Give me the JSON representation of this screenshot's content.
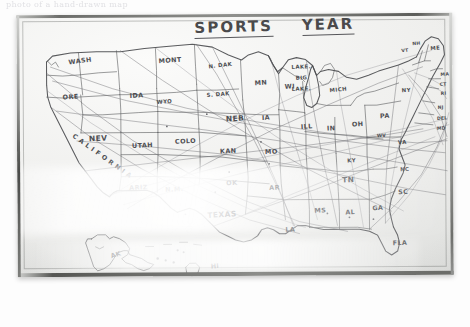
{
  "photo": {
    "top_cut_text": "photo of a hand-drawn map",
    "description": "Photograph of a hand-drawn map of the United States on a light board"
  },
  "board": {
    "title_part1": "SPORTS",
    "title_part2": "YEAR",
    "title_full": "SPORTS YEAR"
  },
  "colors": {
    "ink": "#4c4d50",
    "paper": "#eeeeec",
    "frame": "#55565a",
    "route": "#6d6e72"
  },
  "map": {
    "name": "united-states-hand-drawn-map",
    "labels": [
      {
        "text": "WASH",
        "x": 52,
        "y": 43,
        "size": "s-md",
        "rot": -7,
        "name": "state-label-washington"
      },
      {
        "text": "ORE",
        "x": 46,
        "y": 79,
        "size": "s-md",
        "rot": -4,
        "name": "state-label-oregon"
      },
      {
        "text": "IDA",
        "x": 113,
        "y": 78,
        "size": "s-md",
        "rot": -2,
        "name": "state-label-idaho"
      },
      {
        "text": "MONT",
        "x": 142,
        "y": 43,
        "size": "s-md",
        "rot": -4,
        "name": "state-label-montana"
      },
      {
        "text": "N. DAK",
        "x": 192,
        "y": 49,
        "size": "s-sm",
        "rot": -6,
        "name": "state-label-north-dakota"
      },
      {
        "text": "S. DAK",
        "x": 190,
        "y": 78,
        "size": "s-sm",
        "rot": -4,
        "name": "state-label-south-dakota"
      },
      {
        "text": "MN",
        "x": 238,
        "y": 66,
        "size": "s-md",
        "rot": -3,
        "name": "state-label-minnesota"
      },
      {
        "text": "WI",
        "x": 268,
        "y": 70,
        "size": "s-md",
        "rot": -2,
        "name": "state-label-wisconsin"
      },
      {
        "text": "WYO",
        "x": 140,
        "y": 85,
        "size": "s-sm",
        "rot": -3,
        "name": "state-label-wyoming"
      },
      {
        "text": "NEV",
        "x": 72,
        "y": 120,
        "size": "s-lg",
        "rot": -2,
        "name": "state-label-nevada"
      },
      {
        "text": "UTAH",
        "x": 115,
        "y": 128,
        "size": "s-md",
        "rot": -2,
        "name": "state-label-utah"
      },
      {
        "text": "COLO",
        "x": 158,
        "y": 124,
        "size": "s-md",
        "rot": -2,
        "name": "state-label-colorado"
      },
      {
        "text": "NEB",
        "x": 209,
        "y": 101,
        "size": "s-lg",
        "rot": -3,
        "name": "state-label-nebraska"
      },
      {
        "text": "IA",
        "x": 245,
        "y": 101,
        "size": "s-md",
        "rot": -2,
        "name": "state-label-iowa"
      },
      {
        "text": "KAN",
        "x": 203,
        "y": 134,
        "size": "s-md",
        "rot": -2,
        "name": "state-label-kansas"
      },
      {
        "text": "MO",
        "x": 248,
        "y": 135,
        "size": "s-md",
        "rot": -2,
        "name": "state-label-missouri"
      },
      {
        "text": "ARIZ",
        "x": 112,
        "y": 170,
        "size": "s-md",
        "rot": -2,
        "name": "state-label-arizona"
      },
      {
        "text": "N.M.",
        "x": 148,
        "y": 172,
        "size": "s-md",
        "rot": -2,
        "name": "state-label-new-mexico"
      },
      {
        "text": "OK",
        "x": 209,
        "y": 166,
        "size": "s-md",
        "rot": -2,
        "name": "state-label-oklahoma"
      },
      {
        "text": "AR",
        "x": 252,
        "y": 171,
        "size": "s-md",
        "rot": -2,
        "name": "state-label-arkansas"
      },
      {
        "text": "TEXAS",
        "x": 190,
        "y": 197,
        "size": "s-lg",
        "rot": -3,
        "name": "state-label-texas"
      },
      {
        "text": "LA",
        "x": 268,
        "y": 213,
        "size": "s-md",
        "rot": -2,
        "name": "state-label-louisiana"
      },
      {
        "text": "MS",
        "x": 297,
        "y": 194,
        "size": "s-md",
        "rot": -2,
        "name": "state-label-mississippi"
      },
      {
        "text": "AL",
        "x": 328,
        "y": 196,
        "size": "s-md",
        "rot": -2,
        "name": "state-label-alabama"
      },
      {
        "text": "GA",
        "x": 355,
        "y": 192,
        "size": "s-md",
        "rot": -2,
        "name": "state-label-georgia"
      },
      {
        "text": "SC",
        "x": 381,
        "y": 176,
        "size": "s-md",
        "rot": -2,
        "name": "state-label-south-carolina"
      },
      {
        "text": "NC",
        "x": 383,
        "y": 154,
        "size": "s-sm",
        "rot": -2,
        "name": "state-label-north-carolina"
      },
      {
        "text": "VA",
        "x": 381,
        "y": 127,
        "size": "s-sm",
        "rot": -2,
        "name": "state-label-virginia"
      },
      {
        "text": "TN",
        "x": 325,
        "y": 163,
        "size": "s-lg",
        "rot": -2,
        "name": "state-label-tennessee"
      },
      {
        "text": "KY",
        "x": 330,
        "y": 145,
        "size": "s-sm",
        "rot": -2,
        "name": "state-label-kentucky"
      },
      {
        "text": "FLA",
        "x": 375,
        "y": 227,
        "size": "s-md",
        "rot": -2,
        "name": "state-label-florida"
      },
      {
        "text": "ILL",
        "x": 284,
        "y": 110,
        "size": "s-md",
        "rot": -3,
        "name": "state-label-illinois"
      },
      {
        "text": "IN",
        "x": 310,
        "y": 112,
        "size": "s-md",
        "rot": -2,
        "name": "state-label-indiana"
      },
      {
        "text": "OH",
        "x": 335,
        "y": 108,
        "size": "s-md",
        "rot": -2,
        "name": "state-label-ohio"
      },
      {
        "text": "MICH",
        "x": 313,
        "y": 74,
        "size": "s-sm",
        "rot": -6,
        "name": "state-label-michigan"
      },
      {
        "text": "PA",
        "x": 363,
        "y": 100,
        "size": "s-md",
        "rot": -2,
        "name": "state-label-pennsylvania"
      },
      {
        "text": "NY",
        "x": 385,
        "y": 75,
        "size": "s-sm",
        "rot": -3,
        "name": "state-label-new-york"
      },
      {
        "text": "WV",
        "x": 360,
        "y": 121,
        "size": "s-xs",
        "rot": -2,
        "name": "state-label-west-virginia"
      },
      {
        "text": "VT",
        "x": 385,
        "y": 36,
        "size": "s-xs",
        "rot": -6,
        "name": "state-label-vermont"
      },
      {
        "text": "NH",
        "x": 396,
        "y": 29,
        "size": "s-xs",
        "rot": -6,
        "name": "state-label-new-hampshire"
      },
      {
        "text": "ME",
        "x": 414,
        "y": 33,
        "size": "s-sm",
        "rot": -4,
        "name": "state-label-maine"
      },
      {
        "text": "MA",
        "x": 424,
        "y": 60,
        "size": "s-xs",
        "rot": -3,
        "name": "state-label-massachusetts"
      },
      {
        "text": "CT",
        "x": 423,
        "y": 70,
        "size": "s-xs",
        "rot": -3,
        "name": "state-label-connecticut"
      },
      {
        "text": "RI",
        "x": 424,
        "y": 79,
        "size": "s-xs",
        "rot": -3,
        "name": "state-label-rhode-island"
      },
      {
        "text": "NJ",
        "x": 421,
        "y": 93,
        "size": "s-xs",
        "rot": -3,
        "name": "state-label-new-jersey"
      },
      {
        "text": "DEL",
        "x": 420,
        "y": 104,
        "size": "s-xs",
        "rot": -3,
        "name": "state-label-delaware"
      },
      {
        "text": "MD",
        "x": 420,
        "y": 114,
        "size": "s-xs",
        "rot": -3,
        "name": "state-label-maryland"
      },
      {
        "text": "AK",
        "x": 93,
        "y": 237,
        "size": "s-md",
        "rot": -18,
        "name": "state-label-alaska"
      },
      {
        "text": "HI",
        "x": 193,
        "y": 249,
        "size": "s-md",
        "rot": -4,
        "name": "state-label-hawaii"
      }
    ],
    "annotations": [
      {
        "text": "LAKE.",
        "x": 275,
        "y": 51,
        "size": "s-sm",
        "rot": -2,
        "name": "annotation-lake-1"
      },
      {
        "text": "BIG",
        "x": 279,
        "y": 62,
        "size": "s-sm",
        "rot": -2,
        "name": "annotation-lake-2"
      },
      {
        "text": "LAKE.",
        "x": 275,
        "y": 73,
        "size": "s-sm",
        "rot": -2,
        "name": "annotation-lake-3"
      }
    ],
    "california_letters": [
      "C",
      "A",
      "L",
      "I",
      "F",
      "O",
      "R",
      "N",
      "I",
      "A"
    ]
  }
}
